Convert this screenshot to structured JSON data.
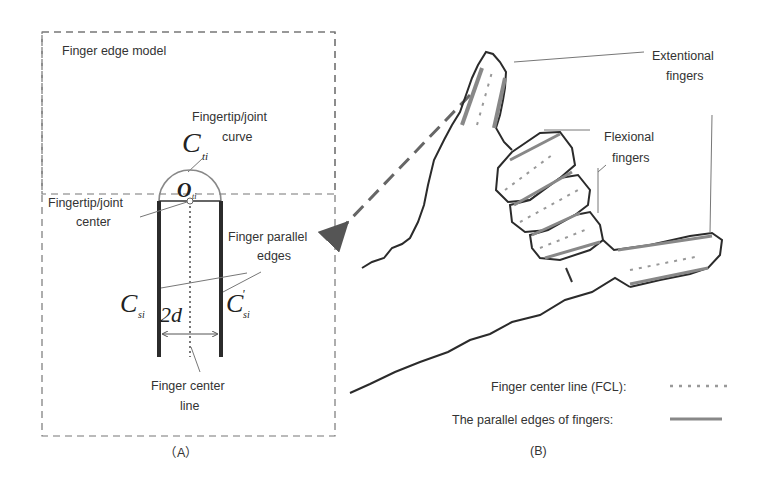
{
  "panel_a": {
    "title": "Finger edge model",
    "caption": "（A）",
    "labels": {
      "tip_curve_line1": "Fingertip/joint",
      "tip_curve_line2": "curve",
      "tip_center_line1": "Fingertip/joint",
      "tip_center_line2": "center",
      "parallel_line1": "Finger parallel",
      "parallel_line2": "edges",
      "center_line1": "Finger center",
      "center_line2": "line"
    },
    "symbols": {
      "c_ti": "C",
      "c_ti_sub": "ti",
      "o_ti": "O",
      "o_ti_sub": "ti",
      "c_si": "C",
      "c_si_sub": "si",
      "c_si_prime": "C",
      "c_si_prime_sup": "'",
      "c_si_prime_sub": "si",
      "width": "2d"
    }
  },
  "panel_b": {
    "caption": "(B)",
    "labels": {
      "extentional_line1": "Extentional",
      "extentional_line2": "fingers",
      "flexional_line1": "Flexional",
      "flexional_line2": "fingers"
    },
    "legend": [
      {
        "label": "Finger center line (FCL):",
        "style": "dotted"
      },
      {
        "label": "The parallel edges of fingers:",
        "style": "solid"
      }
    ]
  },
  "colors": {
    "outline": "#2b2b2b",
    "edge_gray": "#8a8a8a",
    "dash_box": "#777777"
  }
}
